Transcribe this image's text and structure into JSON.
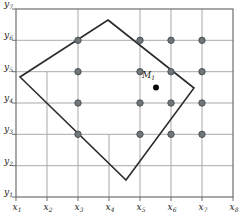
{
  "figure": {
    "background": "#ffffff",
    "plot_area": {
      "left": 16,
      "right": 233,
      "top": 9,
      "bottom": 197
    },
    "colors": {
      "border": "#6e6e6e",
      "grid": "#a9a9a9",
      "boundary": "#2b2b2b",
      "node_fill": "#70757a",
      "node_stroke": "#4e5356",
      "point_fill": "#0a0a0a",
      "label": "#222222"
    },
    "x_axis": {
      "ticks": [
        {
          "base": "x",
          "sub": "1",
          "px": 16
        },
        {
          "base": "x",
          "sub": "2",
          "px": 47
        },
        {
          "base": "x",
          "sub": "3",
          "px": 78
        },
        {
          "base": "x",
          "sub": "4",
          "px": 109
        },
        {
          "base": "x",
          "sub": "5",
          "px": 140
        },
        {
          "base": "x",
          "sub": "6",
          "px": 171
        },
        {
          "base": "x",
          "sub": "7",
          "px": 202
        },
        {
          "base": "x",
          "sub": "8",
          "px": 233
        }
      ],
      "label_baseline_y": 210,
      "tick_len": 4
    },
    "y_axis": {
      "ticks": [
        {
          "base": "y",
          "sub": "1",
          "py": 197
        },
        {
          "base": "y",
          "sub": "2",
          "py": 165.7
        },
        {
          "base": "y",
          "sub": "3",
          "py": 134.3
        },
        {
          "base": "y",
          "sub": "4",
          "py": 103
        },
        {
          "base": "y",
          "sub": "5",
          "py": 71.7
        },
        {
          "base": "y",
          "sub": "6",
          "py": 40.3
        },
        {
          "base": "y",
          "sub": "7",
          "py": 9
        }
      ],
      "label_right_x": 13,
      "tick_len": 4
    },
    "grid": {
      "horizontal_lines_y": [
        40.3,
        71.7,
        103,
        134.3,
        165.7
      ],
      "vertical_full_lines_x": [
        78,
        140,
        171,
        202
      ],
      "vertical_partial_lines": [
        {
          "x": 47,
          "y_from": 71.7,
          "y_to": 197
        },
        {
          "x": 109,
          "y_from": 134.3,
          "y_to": 197
        }
      ]
    },
    "domain_boundary": {
      "vertices": [
        [
          108,
          20
        ],
        [
          194,
          88
        ],
        [
          126,
          180
        ],
        [
          20,
          77
        ]
      ],
      "stroke_width": 1.6
    },
    "grid_nodes": {
      "radius": 3.2,
      "points": [
        [
          78,
          40.3
        ],
        [
          140,
          40.3
        ],
        [
          171,
          40.3
        ],
        [
          202,
          40.3
        ],
        [
          78,
          71.7
        ],
        [
          140,
          71.7
        ],
        [
          171,
          71.7
        ],
        [
          202,
          71.7
        ],
        [
          78,
          103
        ],
        [
          140,
          103
        ],
        [
          171,
          103
        ],
        [
          202,
          103
        ],
        [
          78,
          134.3
        ],
        [
          140,
          134.3
        ],
        [
          171,
          134.3
        ],
        [
          202,
          134.3
        ]
      ]
    },
    "point_M": {
      "x": 156,
      "y": 87.5,
      "radius": 3,
      "label_base": "M",
      "label_sub": "1",
      "label_x": 142,
      "label_y": 78
    }
  }
}
